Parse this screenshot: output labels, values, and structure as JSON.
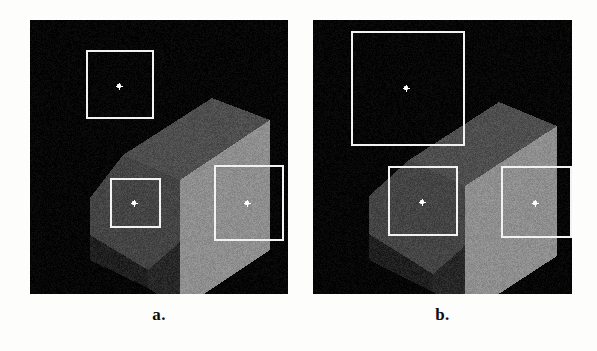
{
  "figure": {
    "background_color": "#fdfdfb",
    "panel_background_color": "#050505",
    "roi_color": "#f2f2f2",
    "marker_color": "#ffffff"
  },
  "panels": [
    {
      "id": "panel-a",
      "caption": "a.",
      "x": 30,
      "y": 20,
      "width": 258,
      "height": 274,
      "description": "Noisy grayscale range image of an L-shaped stepped block",
      "object": {
        "name": "stepped-block",
        "faces": [
          {
            "name": "upper-top-face",
            "gray": "#4a4a4a"
          },
          {
            "name": "upper-front-face",
            "gray": "#2e2e2e"
          },
          {
            "name": "lower-top-face",
            "gray": "#3f3f3f"
          },
          {
            "name": "lower-front-face",
            "gray": "#242424"
          },
          {
            "name": "right-side-face",
            "gray": "#8c8c8c"
          },
          {
            "name": "left-side-face",
            "gray": "#1d1d1d"
          }
        ]
      },
      "roi_boxes": [
        {
          "name": "roi-top-left",
          "x": 86,
          "y": 50,
          "width": 68,
          "height": 69,
          "marker_x": 119,
          "marker_y": 86
        },
        {
          "name": "roi-middle",
          "x": 110,
          "y": 178,
          "width": 51,
          "height": 50,
          "marker_x": 134,
          "marker_y": 203
        },
        {
          "name": "roi-right",
          "x": 214,
          "y": 165,
          "width": 70,
          "height": 76,
          "marker_x": 247,
          "marker_y": 203
        }
      ]
    },
    {
      "id": "panel-b",
      "caption": "b.",
      "x": 313,
      "y": 20,
      "width": 259,
      "height": 274,
      "description": "Same stepped block, slightly rotated, with larger region-of-interest boxes",
      "object": {
        "name": "stepped-block",
        "faces": [
          {
            "name": "upper-top-face",
            "gray": "#4a4a4a"
          },
          {
            "name": "upper-front-face",
            "gray": "#2e2e2e"
          },
          {
            "name": "lower-top-face",
            "gray": "#3f3f3f"
          },
          {
            "name": "lower-front-face",
            "gray": "#242424"
          },
          {
            "name": "right-side-face",
            "gray": "#8c8c8c"
          },
          {
            "name": "left-side-face",
            "gray": "#1d1d1d"
          }
        ]
      },
      "roi_boxes": [
        {
          "name": "roi-top-left",
          "x": 351,
          "y": 31,
          "width": 114,
          "height": 115,
          "marker_x": 406,
          "marker_y": 88
        },
        {
          "name": "roi-middle",
          "x": 388,
          "y": 166,
          "width": 70,
          "height": 70,
          "marker_x": 422,
          "marker_y": 202
        },
        {
          "name": "roi-right",
          "x": 501,
          "y": 166,
          "width": 71,
          "height": 72,
          "marker_x": 535,
          "marker_y": 203
        }
      ]
    }
  ],
  "captions": {
    "a": "a.",
    "b": "b."
  }
}
